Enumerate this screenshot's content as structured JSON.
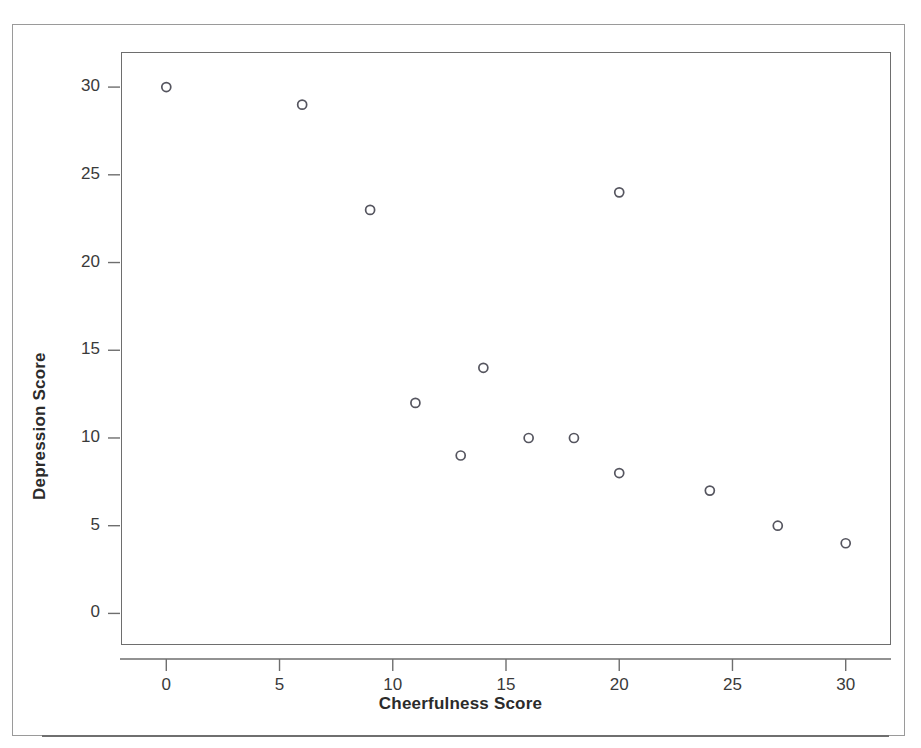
{
  "figure": {
    "kind": "scatterplot",
    "background_color": "#ffffff",
    "frame_color": "#9a9a9a",
    "plot_frame_color": "#6e6e6e",
    "marker_edge_color": "#55555f",
    "marker_fill": "none",
    "text_color": "#2b2b2b"
  },
  "chart_data": {
    "type": "scatter",
    "title": "",
    "xlabel": "Cheerfulness Score",
    "ylabel": "Depression Score",
    "xlim": [
      -2,
      32
    ],
    "ylim": [
      -1.8,
      32
    ],
    "xticks": [
      0,
      5,
      10,
      15,
      20,
      25,
      30
    ],
    "yticks": [
      0,
      5,
      10,
      15,
      20,
      25,
      30
    ],
    "xtick_labels": [
      "0",
      "5",
      "10",
      "15",
      "20",
      "25",
      "30"
    ],
    "ytick_labels": [
      "0",
      "5",
      "10",
      "15",
      "20",
      "25",
      "30"
    ],
    "grid": false,
    "legend": false,
    "legend_position": "none",
    "marker": "open-circle",
    "marker_size": 7,
    "series": [
      {
        "name": "observations",
        "points": [
          {
            "x": 0,
            "y": 30
          },
          {
            "x": 6,
            "y": 29
          },
          {
            "x": 9,
            "y": 23
          },
          {
            "x": 20,
            "y": 24
          },
          {
            "x": 14,
            "y": 14
          },
          {
            "x": 11,
            "y": 12
          },
          {
            "x": 16,
            "y": 10
          },
          {
            "x": 18,
            "y": 10
          },
          {
            "x": 13,
            "y": 9
          },
          {
            "x": 20,
            "y": 8
          },
          {
            "x": 24,
            "y": 7
          },
          {
            "x": 27,
            "y": 5
          },
          {
            "x": 30,
            "y": 4
          }
        ]
      }
    ],
    "x": [
      0,
      6,
      9,
      20,
      14,
      11,
      16,
      18,
      13,
      20,
      24,
      27,
      30
    ],
    "values": [
      30,
      29,
      23,
      24,
      14,
      12,
      10,
      10,
      9,
      8,
      7,
      5,
      4
    ]
  },
  "icons": {
    "y_tick_mark": "tick-mark-icon",
    "x_tick_mark": "tick-mark-icon"
  }
}
